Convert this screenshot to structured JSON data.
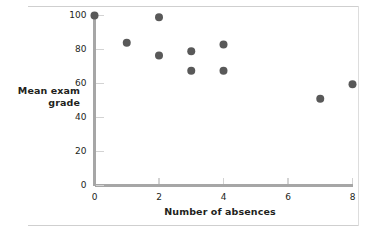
{
  "figure": {
    "name": "scatterplot-figure",
    "background": "#ffffff",
    "axis_color": "#a6a6a6",
    "point_color": "#595959",
    "text_color": "#231f20",
    "rule_color": "#cfcfcf"
  },
  "chart_data": {
    "type": "scatter",
    "title": "",
    "xlabel": "Number of absences",
    "ylabel": "Mean exam grade",
    "ylabel_line1": "Mean exam",
    "ylabel_line2": "grade",
    "xlim": [
      0,
      8
    ],
    "ylim": [
      0,
      100
    ],
    "xticks": [
      0,
      2,
      4,
      6,
      8
    ],
    "yticks": [
      0,
      20,
      40,
      60,
      80,
      100
    ],
    "xtick_labels": [
      "0",
      "2",
      "4",
      "6",
      "8"
    ],
    "ytick_labels": [
      "0",
      "20",
      "40",
      "60",
      "80",
      "100"
    ],
    "grid": false,
    "legend": false,
    "marker": "circle",
    "marker_size": 4,
    "points": [
      {
        "x": 0,
        "y": 100
      },
      {
        "x": 1,
        "y": 84
      },
      {
        "x": 2,
        "y": 99
      },
      {
        "x": 2,
        "y": 76.5
      },
      {
        "x": 3,
        "y": 79
      },
      {
        "x": 3,
        "y": 67.5
      },
      {
        "x": 4,
        "y": 83
      },
      {
        "x": 4,
        "y": 67.5
      },
      {
        "x": 7,
        "y": 51
      },
      {
        "x": 8,
        "y": 59.5
      }
    ]
  }
}
